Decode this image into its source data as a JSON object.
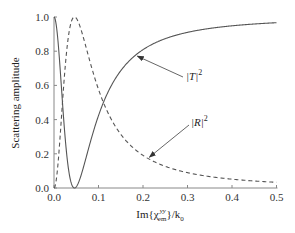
{
  "chart_data": {
    "type": "line",
    "title": "",
    "xlabel": "Im{χ_em^yy}/k_0",
    "xlabel_parts": {
      "pre": "Im{χ",
      "sub": "em",
      "sup": "yy",
      "post": "}/k",
      "post_sub": "0"
    },
    "ylabel": "Scattering amplitude",
    "xlim": [
      0.0,
      0.5
    ],
    "ylim": [
      0.0,
      1.0
    ],
    "xticks": [
      "0.0",
      "0.1",
      "0.2",
      "0.3",
      "0.4",
      "0.5"
    ],
    "yticks": [
      "0.0",
      "0.2",
      "0.4",
      "0.6",
      "0.8",
      "1.0"
    ],
    "grid": false,
    "legend": "none (inline arrow annotations)",
    "x": [
      0.0,
      0.01,
      0.02,
      0.03,
      0.04,
      0.046,
      0.05,
      0.06,
      0.08,
      0.1,
      0.12,
      0.15,
      0.2,
      0.25,
      0.3,
      0.35,
      0.4,
      0.45,
      0.5
    ],
    "series": [
      {
        "name": "|T|^2",
        "style": "solid",
        "values": [
          1.0,
          0.83,
          0.41,
          0.09,
          0.005,
          0.0,
          0.007,
          0.07,
          0.26,
          0.43,
          0.56,
          0.69,
          0.81,
          0.87,
          0.91,
          0.93,
          0.95,
          0.96,
          0.97
        ]
      },
      {
        "name": "|R|^2",
        "style": "dashed",
        "values": [
          0.0,
          0.17,
          0.59,
          0.91,
          0.995,
          1.0,
          0.993,
          0.93,
          0.74,
          0.57,
          0.44,
          0.31,
          0.19,
          0.13,
          0.09,
          0.07,
          0.05,
          0.04,
          0.03
        ]
      }
    ],
    "annotations": [
      {
        "text": "|T|^2",
        "label": "|T|",
        "sup": "2",
        "points_to_series": "|T|^2",
        "at_x": 0.183
      },
      {
        "text": "|R|^2",
        "label": "|R|",
        "sup": "2",
        "points_to_series": "|R|^2",
        "at_x": 0.21
      }
    ]
  }
}
